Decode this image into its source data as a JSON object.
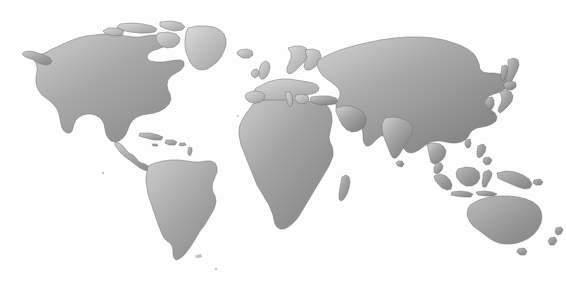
{
  "figure": {
    "kind": "world-map",
    "projection": "equirectangular",
    "title": "World Map",
    "caption": "",
    "background_color": "#ffffff"
  },
  "rule": {
    "name": "top-horizontal-rule",
    "color": "#8f8f8f",
    "x_start": 25,
    "x_end": 545,
    "y": 7,
    "thickness": 1
  },
  "style": {
    "land_gradient_light": "#d9d9d9",
    "land_gradient_mid": "#aeaeae",
    "land_gradient_dark": "#808080",
    "land_outline": "#6e6e6e",
    "ocean_color": "#ffffff"
  },
  "landmasses": [
    {
      "name": "North America",
      "label": "north-america"
    },
    {
      "name": "Greenland",
      "label": "greenland"
    },
    {
      "name": "Canadian Arctic Archipelago",
      "label": "canadian-arctic"
    },
    {
      "name": "Iceland",
      "label": "iceland"
    },
    {
      "name": "Central America",
      "label": "central-america"
    },
    {
      "name": "Cuba",
      "label": "cuba"
    },
    {
      "name": "Hispaniola",
      "label": "hispaniola"
    },
    {
      "name": "South America",
      "label": "south-america"
    },
    {
      "name": "Africa",
      "label": "africa"
    },
    {
      "name": "Madagascar",
      "label": "madagascar"
    },
    {
      "name": "Europe",
      "label": "europe"
    },
    {
      "name": "British Isles",
      "label": "british-isles"
    },
    {
      "name": "Scandinavia",
      "label": "scandinavia"
    },
    {
      "name": "Asia",
      "label": "asia"
    },
    {
      "name": "Arabian Peninsula",
      "label": "arabian-peninsula"
    },
    {
      "name": "India",
      "label": "india"
    },
    {
      "name": "Sri Lanka",
      "label": "sri-lanka"
    },
    {
      "name": "Japan",
      "label": "japan"
    },
    {
      "name": "Sakhalin",
      "label": "sakhalin"
    },
    {
      "name": "Philippines",
      "label": "philippines"
    },
    {
      "name": "Borneo",
      "label": "borneo"
    },
    {
      "name": "Sumatra",
      "label": "sumatra"
    },
    {
      "name": "Java",
      "label": "java"
    },
    {
      "name": "Sulawesi",
      "label": "sulawesi"
    },
    {
      "name": "New Guinea",
      "label": "new-guinea"
    },
    {
      "name": "Australia",
      "label": "australia"
    },
    {
      "name": "Tasmania",
      "label": "tasmania"
    },
    {
      "name": "New Zealand",
      "label": "new-zealand"
    }
  ],
  "water_bodies": [
    {
      "name": "Mediterranean Sea",
      "label": "mediterranean-sea"
    },
    {
      "name": "Black Sea",
      "label": "black-sea"
    },
    {
      "name": "Caspian Sea",
      "label": "caspian-sea"
    },
    {
      "name": "Red Sea",
      "label": "red-sea"
    },
    {
      "name": "Persian Gulf",
      "label": "persian-gulf"
    },
    {
      "name": "Hudson Bay",
      "label": "hudson-bay"
    },
    {
      "name": "Great Lakes",
      "label": "great-lakes"
    },
    {
      "name": "Baltic Sea",
      "label": "baltic-sea"
    }
  ]
}
